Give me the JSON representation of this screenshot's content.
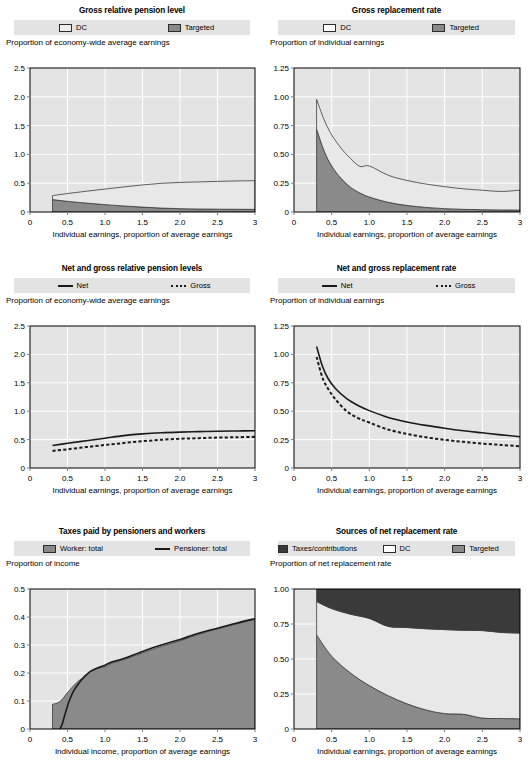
{
  "page": {
    "colors": {
      "plot_background": "#e4e4e4",
      "gridline": "#ffffff",
      "legend_background": "#e3e3e3",
      "dc": "#e8e8e8",
      "targeted": "#8a8a8a",
      "taxes_contributions": "#3a3a3a",
      "worker_total": "#8a8a8a",
      "line": "#1a1a1a"
    }
  },
  "panels": [
    {
      "id": "gross-relative-pension-level",
      "title": "Gross relative pension level",
      "ylabel": "Proportion of economy-wide average earnings",
      "legend": [
        {
          "label": "DC",
          "type": "swatch",
          "color": "#e8e8e8"
        },
        {
          "label": "Targeted",
          "type": "swatch",
          "color": "#8a8a8a"
        }
      ]
    },
    {
      "id": "gross-replacement-rate",
      "title": "Gross replacement rate",
      "ylabel": "Proportion of individual earnings",
      "legend": [
        {
          "label": "DC",
          "type": "swatch",
          "color": "#ffffff"
        },
        {
          "label": "Targeted",
          "type": "swatch",
          "color": "#8a8a8a"
        }
      ]
    },
    {
      "id": "net-and-gross-relative-pension-levels",
      "title": "Net and gross relative pension levels",
      "ylabel": "Proportion of economy-wide average earnings",
      "legend": [
        {
          "label": "Net",
          "type": "line",
          "color": "#1a1a1a"
        },
        {
          "label": "Gross",
          "type": "dashed",
          "color": "#1a1a1a"
        }
      ]
    },
    {
      "id": "net-and-gross-replacement-rate",
      "title": "Net and gross replacement rate",
      "ylabel": "Proportion of individual earnings",
      "legend": [
        {
          "label": "Net",
          "type": "line",
          "color": "#1a1a1a"
        },
        {
          "label": "Gross",
          "type": "dashed",
          "color": "#1a1a1a"
        }
      ]
    },
    {
      "id": "taxes-paid-by-pensioners-and-workers",
      "title": "Taxes paid by pensioners and workers",
      "ylabel": "Proportion of income",
      "legend": [
        {
          "label": "Worker: total",
          "type": "swatch",
          "color": "#8a8a8a"
        },
        {
          "label": "Pensioner: total",
          "type": "line",
          "color": "#1a1a1a"
        }
      ]
    },
    {
      "id": "sources-of-net-replacement-rate",
      "title": "Sources of net replacement rate",
      "ylabel": "Proportion of net replacement rate",
      "legend": [
        {
          "label": "Taxes/contributions",
          "type": "swatch",
          "color": "#3a3a3a"
        },
        {
          "label": "DC",
          "type": "swatch",
          "color": "#ffffff"
        },
        {
          "label": "Targeted",
          "type": "swatch",
          "color": "#8a8a8a"
        }
      ]
    }
  ],
  "chart_data": [
    {
      "id": "gross-relative-pension-level",
      "type": "area",
      "title": "Gross relative pension level",
      "xlabel": "Individual earnings, proportion of average earnings",
      "ylabel": "Proportion of economy-wide average earnings",
      "xlim": [
        0,
        3
      ],
      "ylim": [
        0,
        2.5
      ],
      "xticks": [
        0,
        0.5,
        1.0,
        1.5,
        2.0,
        2.5,
        3
      ],
      "xticklabels": [
        "0",
        "0.5",
        "1.0",
        "1.5",
        "2.0",
        "2.5",
        "3"
      ],
      "yticks": [
        0,
        0.5,
        1.0,
        1.5,
        2.0,
        2.5
      ],
      "yticklabels": [
        "0",
        "0.5",
        "1.0",
        "1.5",
        "2.0",
        "2.5"
      ],
      "grid": true,
      "legend_position": "top",
      "stacked": true,
      "x": [
        0.3,
        0.5,
        0.75,
        1.0,
        1.25,
        1.5,
        1.75,
        2.0,
        2.25,
        2.5,
        2.75,
        3.0
      ],
      "series": [
        {
          "name": "Targeted",
          "color": "#8a8a8a",
          "values": [
            0.215,
            0.185,
            0.155,
            0.128,
            0.105,
            0.085,
            0.068,
            0.058,
            0.052,
            0.049,
            0.047,
            0.046
          ]
        },
        {
          "name": "DC",
          "color": "#e8e8e8",
          "values": [
            0.07,
            0.135,
            0.205,
            0.27,
            0.33,
            0.385,
            0.43,
            0.456,
            0.47,
            0.483,
            0.492,
            0.498
          ]
        }
      ],
      "totals": [
        0.285,
        0.32,
        0.36,
        0.398,
        0.435,
        0.47,
        0.498,
        0.514,
        0.522,
        0.532,
        0.539,
        0.544
      ]
    },
    {
      "id": "gross-replacement-rate",
      "type": "area",
      "title": "Gross replacement rate",
      "xlabel": "Individual earnings, proportion of average earnings",
      "ylabel": "Proportion of individual earnings",
      "xlim": [
        0,
        3
      ],
      "ylim": [
        0,
        1.25
      ],
      "xticks": [
        0,
        0.5,
        1.0,
        1.5,
        2.0,
        2.5,
        3
      ],
      "xticklabels": [
        "0",
        "0.5",
        "1.0",
        "1.5",
        "2.0",
        "2.5",
        "3"
      ],
      "yticks": [
        0,
        0.25,
        0.5,
        0.75,
        1.0,
        1.25
      ],
      "yticklabels": [
        "0",
        "0.25",
        "0.50",
        "0.75",
        "1.00",
        "1.25"
      ],
      "grid": true,
      "legend_position": "top",
      "stacked": true,
      "x": [
        0.3,
        0.4,
        0.5,
        0.625,
        0.75,
        0.875,
        1.0,
        1.25,
        1.5,
        1.75,
        2.0,
        2.25,
        2.5,
        2.75,
        3.0
      ],
      "series": [
        {
          "name": "Targeted",
          "color": "#8a8a8a",
          "values": [
            0.72,
            0.53,
            0.4,
            0.292,
            0.215,
            0.165,
            0.13,
            0.084,
            0.057,
            0.04,
            0.029,
            0.023,
            0.02,
            0.018,
            0.017
          ]
        },
        {
          "name": "DC",
          "color": "#e8e8e8",
          "values": [
            0.258,
            0.27,
            0.27,
            0.262,
            0.25,
            0.23,
            0.27,
            0.235,
            0.217,
            0.203,
            0.191,
            0.178,
            0.169,
            0.16,
            0.173
          ]
        }
      ],
      "totals": [
        0.978,
        0.8,
        0.67,
        0.554,
        0.465,
        0.395,
        0.4,
        0.319,
        0.274,
        0.243,
        0.22,
        0.201,
        0.189,
        0.178,
        0.19
      ]
    },
    {
      "id": "net-and-gross-relative-pension-levels",
      "type": "line",
      "title": "Net and gross relative pension levels",
      "xlabel": "Individual earnings, proportion of average earnings",
      "ylabel": "Proportion of economy-wide average earnings",
      "xlim": [
        0,
        3
      ],
      "ylim": [
        0,
        2.5
      ],
      "xticks": [
        0,
        0.5,
        1.0,
        1.5,
        2.0,
        2.5,
        3
      ],
      "xticklabels": [
        "0",
        "0.5",
        "1.0",
        "1.5",
        "2.0",
        "2.5",
        "3"
      ],
      "yticks": [
        0,
        0.5,
        1.0,
        1.5,
        2.0,
        2.5
      ],
      "yticklabels": [
        "0",
        "0.5",
        "1.0",
        "1.5",
        "2.0",
        "2.5"
      ],
      "grid": true,
      "legend_position": "top",
      "x": [
        0.3,
        0.5,
        0.75,
        1.0,
        1.25,
        1.5,
        1.75,
        2.0,
        2.25,
        2.5,
        2.75,
        3.0
      ],
      "series": [
        {
          "name": "Net",
          "color": "#1a1a1a",
          "style": "solid",
          "values": [
            0.395,
            0.435,
            0.48,
            0.525,
            0.57,
            0.6,
            0.62,
            0.632,
            0.64,
            0.648,
            0.652,
            0.655
          ]
        },
        {
          "name": "Gross",
          "color": "#1a1a1a",
          "style": "dashed",
          "values": [
            0.3,
            0.33,
            0.368,
            0.405,
            0.44,
            0.472,
            0.497,
            0.514,
            0.525,
            0.535,
            0.542,
            0.548
          ]
        }
      ]
    },
    {
      "id": "net-and-gross-replacement-rate",
      "type": "line",
      "title": "Net and gross replacement rate",
      "xlabel": "Individual earnings, proportion of average earnings",
      "ylabel": "Proportion of individual earnings",
      "xlim": [
        0,
        3
      ],
      "ylim": [
        0,
        1.25
      ],
      "xticks": [
        0,
        0.5,
        1.0,
        1.5,
        2.0,
        2.5,
        3
      ],
      "xticklabels": [
        "0",
        "0.5",
        "1.0",
        "1.5",
        "2.0",
        "2.5",
        "3"
      ],
      "yticks": [
        0,
        0.25,
        0.5,
        0.75,
        1.0,
        1.25
      ],
      "yticklabels": [
        "0",
        "0.25",
        "0.50",
        "0.75",
        "1.00",
        "1.25"
      ],
      "grid": true,
      "legend_position": "top",
      "x": [
        0.3,
        0.375,
        0.45,
        0.55,
        0.7,
        0.85,
        1.0,
        1.25,
        1.5,
        1.75,
        2.0,
        2.25,
        2.5,
        2.75,
        3.0
      ],
      "series": [
        {
          "name": "Net",
          "color": "#1a1a1a",
          "style": "solid",
          "values": [
            1.07,
            0.9,
            0.79,
            0.7,
            0.61,
            0.55,
            0.505,
            0.445,
            0.405,
            0.375,
            0.35,
            0.328,
            0.31,
            0.292,
            0.275
          ]
        },
        {
          "name": "Gross",
          "color": "#1a1a1a",
          "style": "dashed",
          "values": [
            0.978,
            0.8,
            0.7,
            0.605,
            0.5,
            0.44,
            0.4,
            0.338,
            0.3,
            0.27,
            0.248,
            0.23,
            0.215,
            0.203,
            0.192
          ]
        }
      ]
    },
    {
      "id": "taxes-paid-by-pensioners-and-workers",
      "type": "area",
      "title": "Taxes paid by pensioners and workers",
      "xlabel": "Individual income, proportion of average earnings",
      "ylabel": "Proportion of income",
      "xlim": [
        0,
        3
      ],
      "ylim": [
        0,
        0.5
      ],
      "xticks": [
        0,
        0.5,
        1.0,
        1.5,
        2.0,
        2.5,
        3
      ],
      "xticklabels": [
        "0",
        "0.5",
        "1.0",
        "1.5",
        "2.0",
        "2.5",
        "3"
      ],
      "yticks": [
        0,
        0.1,
        0.2,
        0.3,
        0.4,
        0.5
      ],
      "yticklabels": [
        "0",
        "0.1",
        "0.2",
        "0.3",
        "0.4",
        "0.5"
      ],
      "grid": true,
      "legend_position": "top",
      "series": [
        {
          "name": "Worker: total",
          "color": "#8a8a8a",
          "style": "area",
          "x": [
            0.3,
            0.4,
            0.5,
            0.6,
            0.7,
            0.8,
            0.9,
            1.0,
            1.1,
            1.25,
            1.5,
            1.75,
            2.0,
            2.25,
            2.5,
            2.75,
            3.0
          ],
          "values": [
            0.088,
            0.098,
            0.13,
            0.16,
            0.183,
            0.205,
            0.216,
            0.223,
            0.236,
            0.248,
            0.272,
            0.295,
            0.315,
            0.338,
            0.358,
            0.375,
            0.392
          ]
        },
        {
          "name": "Pensioner: total",
          "color": "#1a1a1a",
          "style": "solid",
          "x": [
            0.4,
            0.43,
            0.47,
            0.52,
            0.58,
            0.65,
            0.72,
            0.8,
            0.9,
            1.0,
            1.1,
            1.25,
            1.5,
            1.75,
            2.0,
            2.25,
            2.5,
            2.75,
            3.0
          ],
          "values": [
            0.0,
            0.018,
            0.055,
            0.098,
            0.135,
            0.163,
            0.185,
            0.205,
            0.218,
            0.228,
            0.24,
            0.252,
            0.277,
            0.3,
            0.32,
            0.342,
            0.36,
            0.378,
            0.394
          ]
        }
      ]
    },
    {
      "id": "sources-of-net-replacement-rate",
      "type": "area",
      "title": "Sources of net replacement rate",
      "xlabel": "Individual earnings, proportion of average earnings",
      "ylabel": "Proportion of net replacement rate",
      "xlim": [
        0,
        3
      ],
      "ylim": [
        0,
        1.0
      ],
      "xticks": [
        0,
        0.5,
        1.0,
        1.5,
        2.0,
        2.5,
        3
      ],
      "xticklabels": [
        "0",
        "0.5",
        "1.0",
        "1.5",
        "2.0",
        "2.5",
        "3"
      ],
      "yticks": [
        0,
        0.25,
        0.5,
        0.75,
        1.0
      ],
      "yticklabels": [
        "0",
        "0.25",
        "0.50",
        "0.75",
        "1.00"
      ],
      "grid": true,
      "legend_position": "top",
      "stacked": true,
      "x": [
        0.3,
        0.5,
        0.75,
        1.0,
        1.25,
        1.5,
        1.75,
        2.0,
        2.25,
        2.5,
        2.75,
        3.0
      ],
      "series": [
        {
          "name": "Targeted",
          "color": "#8a8a8a",
          "values": [
            0.672,
            0.52,
            0.4,
            0.31,
            0.238,
            0.18,
            0.136,
            0.11,
            0.105,
            0.078,
            0.075,
            0.073
          ]
        },
        {
          "name": "DC",
          "color": "#e8e8e8",
          "values": [
            0.238,
            0.34,
            0.42,
            0.48,
            0.495,
            0.545,
            0.58,
            0.6,
            0.6,
            0.625,
            0.615,
            0.612
          ]
        },
        {
          "name": "Taxes/contributions",
          "color": "#3a3a3a",
          "values": [
            0.09,
            0.14,
            0.18,
            0.21,
            0.267,
            0.275,
            0.284,
            0.29,
            0.295,
            0.297,
            0.31,
            0.315
          ]
        }
      ]
    }
  ]
}
